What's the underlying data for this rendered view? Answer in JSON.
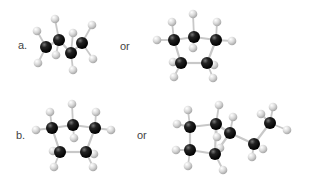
{
  "labels": {
    "a": "a.",
    "b": "b.",
    "or_a": "or",
    "or_b": "or"
  },
  "colors": {
    "carbon": "#111111",
    "hydrogen": "#d4d4d4",
    "bond": "#c8c8c8"
  },
  "molecules": [
    {
      "id": "a-left",
      "name": "butane",
      "carbons": [
        [
          46,
          47
        ],
        [
          59,
          40
        ],
        [
          71,
          53
        ],
        [
          82,
          43
        ]
      ],
      "hydrogens": [
        [
          37,
          31
        ],
        [
          55,
          19
        ],
        [
          73,
          33
        ],
        [
          92,
          25
        ],
        [
          38,
          63
        ],
        [
          56,
          55
        ],
        [
          73,
          70
        ],
        [
          93,
          59
        ]
      ],
      "cc_bonds": [
        [
          0,
          1
        ],
        [
          1,
          2
        ],
        [
          2,
          3
        ]
      ],
      "ch_bonds": [
        [
          0,
          0
        ],
        [
          1,
          1
        ],
        [
          2,
          2
        ],
        [
          3,
          3
        ],
        [
          0,
          4
        ],
        [
          1,
          5
        ],
        [
          2,
          6
        ],
        [
          3,
          7
        ]
      ]
    },
    {
      "id": "a-right",
      "name": "cyclopentane",
      "carbons": [
        [
          174,
          40
        ],
        [
          194,
          37
        ],
        [
          216,
          40
        ],
        [
          181,
          63
        ],
        [
          207,
          63
        ]
      ],
      "hydrogens": [
        [
          172,
          22
        ],
        [
          193,
          14
        ],
        [
          217,
          22
        ],
        [
          157,
          40
        ],
        [
          232,
          41
        ],
        [
          193,
          48
        ],
        [
          173,
          62
        ],
        [
          214,
          65
        ],
        [
          174,
          77
        ],
        [
          213,
          78
        ]
      ],
      "cc_bonds": [
        [
          0,
          1
        ],
        [
          1,
          2
        ],
        [
          2,
          4
        ],
        [
          4,
          3
        ],
        [
          3,
          0
        ]
      ],
      "ch_bonds": [
        [
          0,
          0
        ],
        [
          1,
          1
        ],
        [
          2,
          2
        ],
        [
          0,
          3
        ],
        [
          2,
          4
        ],
        [
          1,
          5
        ],
        [
          3,
          6
        ],
        [
          4,
          7
        ],
        [
          3,
          8
        ],
        [
          4,
          9
        ]
      ]
    },
    {
      "id": "b-left",
      "name": "cyclopentane",
      "carbons": [
        [
          52,
          128
        ],
        [
          73,
          125
        ],
        [
          95,
          128
        ],
        [
          60,
          152
        ],
        [
          86,
          152
        ]
      ],
      "hydrogens": [
        [
          50,
          112
        ],
        [
          72,
          104
        ],
        [
          96,
          112
        ],
        [
          36,
          130
        ],
        [
          111,
          130
        ],
        [
          74,
          138
        ],
        [
          53,
          151
        ],
        [
          94,
          154
        ],
        [
          54,
          167
        ],
        [
          93,
          167
        ]
      ],
      "cc_bonds": [
        [
          0,
          1
        ],
        [
          1,
          2
        ],
        [
          2,
          4
        ],
        [
          4,
          3
        ],
        [
          3,
          0
        ]
      ],
      "ch_bonds": [
        [
          0,
          0
        ],
        [
          1,
          1
        ],
        [
          2,
          2
        ],
        [
          0,
          3
        ],
        [
          2,
          4
        ],
        [
          1,
          5
        ],
        [
          3,
          6
        ],
        [
          4,
          7
        ],
        [
          3,
          8
        ],
        [
          4,
          9
        ]
      ]
    },
    {
      "id": "b-right",
      "name": "ethylcyclobutane",
      "carbons": [
        [
          190,
          127
        ],
        [
          216,
          124
        ],
        [
          230,
          133
        ],
        [
          190,
          150
        ],
        [
          215,
          154
        ],
        [
          254,
          144
        ],
        [
          270,
          123
        ]
      ],
      "hydrogens": [
        [
          188,
          110
        ],
        [
          219,
          105
        ],
        [
          177,
          124
        ],
        [
          233,
          117
        ],
        [
          217,
          137
        ],
        [
          176,
          150
        ],
        [
          188,
          166
        ],
        [
          223,
          170
        ],
        [
          252,
          157
        ],
        [
          263,
          149
        ],
        [
          261,
          114
        ],
        [
          273,
          107
        ],
        [
          287,
          130
        ],
        [
          220,
          148
        ]
      ],
      "cc_bonds": [
        [
          0,
          1
        ],
        [
          1,
          4
        ],
        [
          4,
          3
        ],
        [
          3,
          0
        ],
        [
          1,
          2
        ],
        [
          2,
          4
        ],
        [
          2,
          5
        ],
        [
          5,
          6
        ]
      ],
      "ch_bonds": [
        [
          0,
          0
        ],
        [
          1,
          1
        ],
        [
          0,
          2
        ],
        [
          2,
          3
        ],
        [
          1,
          4
        ],
        [
          3,
          5
        ],
        [
          3,
          6
        ],
        [
          4,
          7
        ],
        [
          5,
          8
        ],
        [
          5,
          9
        ],
        [
          6,
          10
        ],
        [
          6,
          11
        ],
        [
          6,
          12
        ],
        [
          4,
          13
        ]
      ]
    }
  ]
}
